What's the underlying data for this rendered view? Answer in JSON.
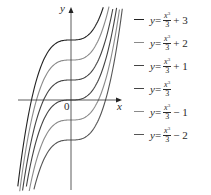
{
  "chart_data": {
    "type": "line",
    "title": "",
    "xlabel": "x",
    "ylabel": "y",
    "origin_label": "0",
    "xlim": [
      -3,
      3
    ],
    "ylim": [
      -5,
      5
    ],
    "grid": false,
    "legend_position": "right",
    "series": [
      {
        "name": "y = x^3/3 + 3",
        "constant": 3,
        "color": "#222222"
      },
      {
        "name": "y = x^3/3 + 2",
        "constant": 2,
        "color": "#8a8a8a"
      },
      {
        "name": "y = x^3/3 + 1",
        "constant": 1,
        "color": "#444444"
      },
      {
        "name": "y = x^3/3",
        "constant": 0,
        "color": "#444444"
      },
      {
        "name": "y = x^3/3 - 1",
        "constant": -1,
        "color": "#8a8a8a"
      },
      {
        "name": "y = x^3/3 - 2",
        "constant": -2,
        "color": "#555555"
      }
    ]
  },
  "legend": [
    {
      "y": "y",
      "eq": " = ",
      "num": "x",
      "pow": "3",
      "den": "3",
      "tail": "+ 3",
      "color": "#222222"
    },
    {
      "y": "y",
      "eq": " = ",
      "num": "x",
      "pow": "3",
      "den": "3",
      "tail": "+ 2",
      "color": "#8a8a8a"
    },
    {
      "y": "y",
      "eq": " = ",
      "num": "x",
      "pow": "3",
      "den": "3",
      "tail": "+ 1",
      "color": "#444444"
    },
    {
      "y": "y",
      "eq": " = ",
      "num": "x",
      "pow": "3",
      "den": "3",
      "tail": "",
      "color": "#444444"
    },
    {
      "y": "y",
      "eq": " = ",
      "num": "x",
      "pow": "3",
      "den": "3",
      "tail": "− 1",
      "color": "#8a8a8a"
    },
    {
      "y": "y",
      "eq": " = ",
      "num": "x",
      "pow": "3",
      "den": "3",
      "tail": "− 2",
      "color": "#555555"
    }
  ]
}
